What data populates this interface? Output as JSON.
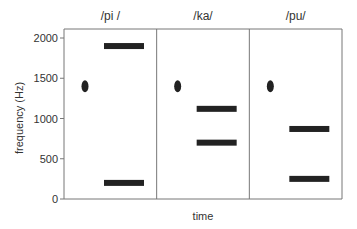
{
  "chart_data": {
    "type": "bar",
    "subtype": "schematic-spectrogram",
    "xlabel": "time",
    "ylabel": "frequency (Hz)",
    "ylim": [
      0,
      2000
    ],
    "yticks": [
      0,
      500,
      1000,
      1500,
      2000
    ],
    "ytick_labels": [
      "0",
      "500",
      "1000",
      "1500",
      "2000"
    ],
    "grid": false,
    "legend": "none",
    "colors": {
      "mark": "#222222",
      "axis": "#777777",
      "text": "#333333"
    },
    "panels": [
      {
        "title": "/pi /",
        "burst_hz": 1400,
        "formants_hz": [
          1900,
          200
        ]
      },
      {
        "title": "/ka/",
        "burst_hz": 1400,
        "formants_hz": [
          1120,
          700
        ]
      },
      {
        "title": "/pu/",
        "burst_hz": 1400,
        "formants_hz": [
          870,
          250
        ]
      }
    ]
  }
}
